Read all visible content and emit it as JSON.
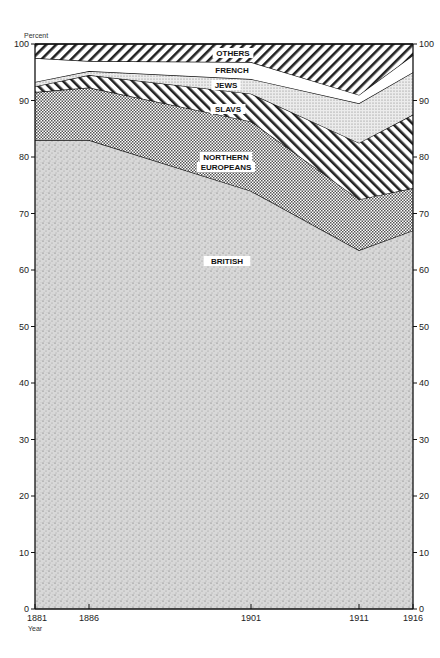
{
  "chart_data": {
    "type": "area",
    "stacked": true,
    "title": "",
    "xlabel": "Year",
    "ylabel": "Percent",
    "ylim": [
      0,
      100
    ],
    "grid": false,
    "legend": "inline labels",
    "x": [
      1881,
      1886,
      1901,
      1911,
      1916
    ],
    "x_tick_labels": [
      "1881",
      "1886",
      "1901",
      "1911",
      "1916"
    ],
    "y_ticks": [
      0,
      10,
      20,
      30,
      40,
      50,
      60,
      70,
      80,
      90,
      100
    ],
    "y_ticks_right": [
      0,
      10,
      20,
      30,
      40,
      50,
      60,
      70,
      80,
      90,
      100
    ],
    "series": [
      {
        "name": "BRITISH",
        "values": [
          83,
          83,
          74,
          63.5,
          67
        ],
        "pattern": "stipple"
      },
      {
        "name": "NORTHERN EUROPEANS",
        "values": [
          8.5,
          9.3,
          12.3,
          9,
          7.5
        ],
        "pattern": "dense-dots"
      },
      {
        "name": "SLAVS",
        "values": [
          1,
          2.2,
          4.9,
          10,
          13
        ],
        "pattern": "diagonal-hatch"
      },
      {
        "name": "JEWS",
        "values": [
          0.8,
          0.7,
          2.6,
          7,
          7.5
        ],
        "pattern": "fine-dots"
      },
      {
        "name": "FRENCH",
        "values": [
          4.2,
          1.8,
          3,
          1.5,
          3
        ],
        "pattern": "white"
      },
      {
        "name": "OTHERS",
        "values": [
          2.5,
          3,
          3.2,
          9,
          2
        ],
        "pattern": "diagonal-hatch"
      }
    ],
    "labels": {
      "others": "OTHERS",
      "french": "FRENCH",
      "jews": "JEWS",
      "slavs": "SLAVS",
      "northern_1": "NORTHERN",
      "northern_2": "EUROPEANS",
      "british": "BRITISH"
    },
    "axis": {
      "y_title": "Percent",
      "x_title": "Year"
    }
  }
}
